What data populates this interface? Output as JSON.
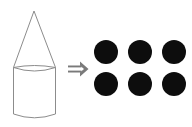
{
  "scene": {
    "title": "Cone-topped cylinder equals six dots",
    "background_color": "#ffffff",
    "width": 192,
    "height": 127
  },
  "left_figure": {
    "name": "cone-on-cylinder",
    "label": "cone on cylinder",
    "outline_color": "#8c8c8c",
    "fill_color": "none",
    "stroke_width": 1,
    "cone": {
      "apex_x": 34,
      "apex_y": 11,
      "base_left_x": 13,
      "base_right_x": 56,
      "base_y": 68
    },
    "cylinder": {
      "left_x": 13,
      "right_x": 56,
      "top_y": 68,
      "bottom_y": 118,
      "ellipse_rx": 21.5,
      "ellipse_ry": 4
    }
  },
  "arrow": {
    "name": "double-right-arrow",
    "glyph": "⇒",
    "color": "#7a7a7a",
    "x": 68,
    "y": 68,
    "width": 20,
    "height": 12
  },
  "right_figure": {
    "name": "dot-grid",
    "label": "six black circles",
    "dot_color": "#0d0d0d",
    "count": 6,
    "rows": 2,
    "columns": 3,
    "diameter": 24,
    "radius": 12,
    "grid_left": 94,
    "grid_top": 40,
    "col_spacing": 34,
    "row_spacing": 32,
    "dots": [
      {
        "index": 1,
        "row": 1,
        "col": 1,
        "cx": 106,
        "cy": 52
      },
      {
        "index": 2,
        "row": 1,
        "col": 2,
        "cx": 140,
        "cy": 52
      },
      {
        "index": 3,
        "row": 1,
        "col": 3,
        "cx": 174,
        "cy": 52
      },
      {
        "index": 4,
        "row": 2,
        "col": 1,
        "cx": 106,
        "cy": 84
      },
      {
        "index": 5,
        "row": 2,
        "col": 2,
        "cx": 140,
        "cy": 84
      },
      {
        "index": 6,
        "row": 2,
        "col": 3,
        "cx": 174,
        "cy": 84
      }
    ]
  }
}
